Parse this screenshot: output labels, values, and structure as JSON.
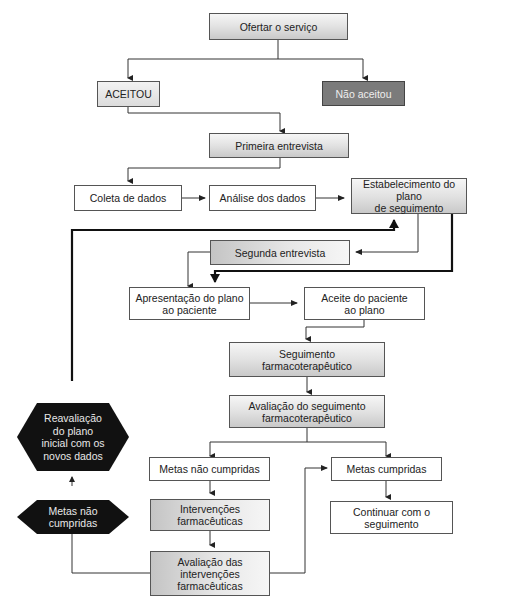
{
  "diagram": {
    "nodes": {
      "ofertar": "Ofertar o serviço",
      "aceitou": "ACEITOU",
      "nao_aceitou": "Não aceitou",
      "primeira_entrevista": "Primeira entrevista",
      "coleta": "Coleta de dados",
      "analise": "Análise dos dados",
      "estabelecimento_l1": "Estabelecimento do plano",
      "estabelecimento_l2": "de seguimento",
      "segunda_entrevista": "Segunda entrevista",
      "apresentacao_l1": "Apresentação do plano",
      "apresentacao_l2": "ao paciente",
      "aceite_l1": "Aceite do paciente",
      "aceite_l2": "ao plano",
      "seguimento_l1": "Seguimento",
      "seguimento_l2": "farmacoterapêutico",
      "avaliacao_seg_l1": "Avaliação do seguimento",
      "avaliacao_seg_l2": "farmacoterapêutico",
      "metas_nao": "Metas não cumpridas",
      "metas_sim": "Metas cumpridas",
      "intervencoes_l1": "Intervenções",
      "intervencoes_l2": "farmacêuticas",
      "continuar_l1": "Continuar com o",
      "continuar_l2": "seguimento",
      "avaliacao_int_l1": "Avaliação das",
      "avaliacao_int_l2": "intervenções",
      "avaliacao_int_l3": "farmacêuticas",
      "reavaliacao_l1": "Reavaliação",
      "reavaliacao_l2": "do plano",
      "reavaliacao_l3": "inicial com os",
      "reavaliacao_l4": "novos dados",
      "hex_metas_l1": "Metas não",
      "hex_metas_l2": "cumpridas"
    },
    "colors": {
      "line": "#333333",
      "dark_box": "#7b7b7b",
      "hexagon": "#111111"
    }
  }
}
